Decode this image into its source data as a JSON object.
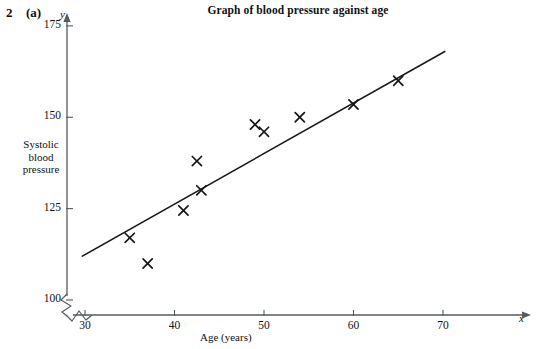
{
  "question": {
    "number": "2",
    "part": "(a)"
  },
  "chart_data": {
    "type": "scatter",
    "title": "Graph of blood pressure against age",
    "xlabel": "Age (years)",
    "ylabel": "Systolic blood pressure",
    "ylabel_lines": [
      "Systolic",
      "blood",
      "pressure"
    ],
    "x_axis_letter": "x",
    "y_axis_letter": "y",
    "xlim": [
      28,
      71
    ],
    "ylim": [
      93,
      178
    ],
    "xticks": [
      30,
      40,
      50,
      60,
      70
    ],
    "xtick_labels": [
      "30",
      "40",
      "50",
      "60",
      "70"
    ],
    "yticks": [
      100,
      125,
      150,
      175
    ],
    "ytick_labels": [
      "100",
      "125",
      "150",
      "175"
    ],
    "grid": false,
    "legend": false,
    "y_axis_break": true,
    "x_axis_break": true,
    "points": [
      {
        "x": 35,
        "y": 117
      },
      {
        "x": 37,
        "y": 110
      },
      {
        "x": 41,
        "y": 124.5
      },
      {
        "x": 42.5,
        "y": 138
      },
      {
        "x": 43,
        "y": 130
      },
      {
        "x": 49,
        "y": 148
      },
      {
        "x": 50,
        "y": 146
      },
      {
        "x": 54,
        "y": 150
      },
      {
        "x": 60,
        "y": 153.5
      },
      {
        "x": 65,
        "y": 160
      }
    ],
    "trend_line": {
      "label": "line of best fit",
      "x_start": 29.7,
      "y_start": 112,
      "x_end": 70.2,
      "y_end": 168
    },
    "marker_style": "x",
    "marker_color": "#15161a",
    "line_color": "#1a1a1a",
    "axis_color": "#555b5e"
  }
}
